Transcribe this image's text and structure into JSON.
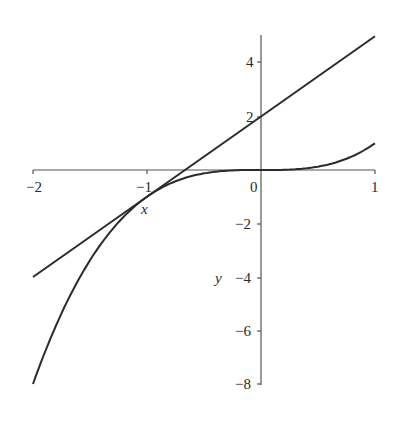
{
  "chart_data": {
    "type": "line",
    "title": "",
    "xlabel": "x",
    "ylabel": "y",
    "xlim": [
      -2,
      1
    ],
    "ylim": [
      -8,
      5
    ],
    "grid": false,
    "legend": null,
    "x_ticks": [
      -2,
      -1,
      0,
      1
    ],
    "y_ticks": [
      -8,
      -6,
      -4,
      -2,
      2,
      4
    ],
    "x_tick_labels": [
      "−2",
      "−1",
      "0",
      "1"
    ],
    "y_tick_labels": [
      "−8",
      "−6",
      "−4",
      "−2",
      "2",
      "4"
    ],
    "series": [
      {
        "name": "y = x^3",
        "x": [
          -2,
          -1.75,
          -1.5,
          -1.25,
          -1,
          -0.75,
          -0.5,
          -0.25,
          0,
          0.25,
          0.5,
          0.75,
          1
        ],
        "values": [
          -8,
          -5.359,
          -3.375,
          -1.953,
          -1,
          -0.422,
          -0.125,
          -0.016,
          0,
          0.016,
          0.125,
          0.422,
          1
        ]
      },
      {
        "name": "tangent line y = 3x + 2 at x = -1",
        "x": [
          -2,
          1
        ],
        "values": [
          -4,
          5
        ]
      }
    ],
    "annotations": [
      {
        "text": "x",
        "role": "x-axis label",
        "near": [
          -0.9,
          -1.4
        ]
      },
      {
        "text": "y",
        "role": "y-axis label",
        "near": [
          -0.35,
          -4
        ]
      }
    ]
  }
}
